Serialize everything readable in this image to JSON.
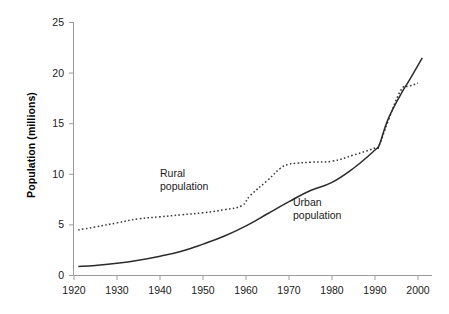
{
  "chart_data": {
    "type": "line",
    "title": "",
    "xlabel": "",
    "ylabel": "Population (millions)",
    "xlim": [
      1920,
      2002
    ],
    "ylim": [
      0,
      25
    ],
    "xticks": [
      1920,
      1930,
      1940,
      1950,
      1960,
      1970,
      1980,
      1990,
      2000
    ],
    "yticks": [
      0,
      5,
      10,
      15,
      20,
      25
    ],
    "xtick_labels": [
      "1920",
      "1930",
      "1940",
      "1950",
      "1960",
      "1970",
      "1980",
      "1990",
      "2000"
    ],
    "ytick_labels": [
      "0",
      "5",
      "10",
      "15",
      "20",
      "25"
    ],
    "grid": false,
    "legend_position": "inline-annotations",
    "series": [
      {
        "name": "Rural population",
        "style": "dotted",
        "color": "#3a3a3a",
        "x": [
          1921,
          1925,
          1930,
          1935,
          1940,
          1945,
          1950,
          1955,
          1959,
          1961,
          1965,
          1968,
          1970,
          1972,
          1975,
          1980,
          1985,
          1990,
          1991,
          1993,
          1996,
          1998,
          2000
        ],
        "values": [
          4.5,
          4.8,
          5.2,
          5.6,
          5.8,
          6.0,
          6.2,
          6.5,
          6.9,
          7.9,
          9.4,
          10.6,
          11.0,
          11.1,
          11.2,
          11.3,
          11.9,
          12.6,
          12.9,
          15.2,
          18.3,
          18.7,
          19.0
        ]
      },
      {
        "name": "Urban population",
        "style": "solid",
        "color": "#2b2b2b",
        "x": [
          1921,
          1925,
          1930,
          1935,
          1940,
          1945,
          1950,
          1955,
          1960,
          1965,
          1970,
          1975,
          1980,
          1985,
          1990,
          1991,
          1993,
          1996,
          1998,
          2001
        ],
        "values": [
          0.9,
          1.0,
          1.2,
          1.5,
          1.9,
          2.4,
          3.1,
          3.9,
          4.9,
          6.1,
          7.3,
          8.4,
          9.2,
          10.6,
          12.4,
          12.9,
          15.4,
          17.9,
          19.3,
          21.5
        ]
      }
    ],
    "annotations": [
      {
        "text_line1": "Rural",
        "text_line2": "population",
        "series": "Rural population"
      },
      {
        "text_line1": "Urban",
        "text_line2": "population",
        "series": "Urban population"
      }
    ]
  },
  "axes": {
    "y_axis_title": "Population (millions)"
  },
  "labels": {
    "rural_line1": "Rural",
    "rural_line2": "population",
    "urban_line1": "Urban",
    "urban_line2": "population"
  }
}
